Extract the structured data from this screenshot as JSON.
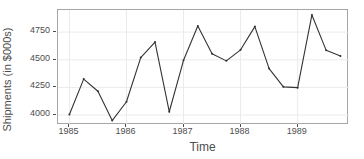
{
  "chart_data": {
    "type": "line",
    "title": "",
    "xlabel": "Time",
    "ylabel": "Shipments (in $000s)",
    "x": [
      1985.0,
      1985.25,
      1985.5,
      1985.75,
      1986.0,
      1986.25,
      1986.5,
      1986.75,
      1987.0,
      1987.25,
      1987.5,
      1987.75,
      1988.0,
      1988.25,
      1988.5,
      1988.75,
      1989.0,
      1989.25,
      1989.5,
      1989.75
    ],
    "values": [
      4005,
      4325,
      4215,
      3950,
      4120,
      4520,
      4660,
      4030,
      4495,
      4805,
      4555,
      4490,
      4590,
      4800,
      4420,
      4255,
      4248,
      4905,
      4585,
      4535
    ],
    "xtick_labels": [
      "1985",
      "1986",
      "1987",
      "1988",
      "1989"
    ],
    "xtick_values": [
      1985,
      1986,
      1987,
      1988,
      1989
    ],
    "ytick_labels": [
      "4000",
      "4250",
      "4500",
      "4750"
    ],
    "ytick_values": [
      4000,
      4250,
      4500,
      4750
    ],
    "xlim": [
      1984.8,
      1989.9
    ],
    "ylim": [
      3910,
      4950
    ],
    "grid": true,
    "legend": null,
    "line_color": "#333333",
    "point_color": "#333333",
    "grid_color": "#ebebeb",
    "panel_border_color": "#a6a6a6",
    "background": "#ffffff",
    "text_color": "#4d4d4d"
  }
}
